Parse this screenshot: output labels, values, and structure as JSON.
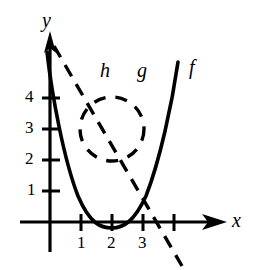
{
  "figure": {
    "background_color": "#ffffff",
    "ink_color": "#000000"
  },
  "axes": {
    "x_axis_label": "x",
    "y_axis_label": "y",
    "origin_px": [
      50,
      222
    ],
    "unit_px": 31,
    "x_ticks": [
      {
        "value": "1",
        "label": "1"
      },
      {
        "value": "2",
        "label": "2"
      },
      {
        "value": "3",
        "label": "3"
      },
      {
        "value": "4",
        "label": ""
      }
    ],
    "y_ticks": [
      {
        "value": "1",
        "label": "1"
      },
      {
        "value": "2",
        "label": "2"
      },
      {
        "value": "3",
        "label": "3"
      },
      {
        "value": "4",
        "label": "4"
      }
    ],
    "x_arrow": true,
    "y_arrow": true,
    "grid": false
  },
  "curves": [
    {
      "name": "f",
      "label": "f",
      "style": "solid",
      "kind": "parabola",
      "equation": "y = (x - 2)^2",
      "vertex": [
        2,
        0
      ],
      "y_intercept": 4,
      "color": "#000000",
      "stroke_width": 3.2
    },
    {
      "name": "h",
      "label": "h",
      "style": "dashed",
      "kind": "circle",
      "equation": "(x - 2)^2 + (y - 3)^2 = 1",
      "center": [
        2,
        3
      ],
      "radius": 1,
      "color": "#000000",
      "stroke_width": 3.2
    },
    {
      "name": "g",
      "label": "g",
      "style": "dashed",
      "kind": "line",
      "equation": "y = -1.55x + 5.6",
      "slope": -1.55,
      "y_intercept": 5.6,
      "x_intercept": 3.6,
      "color": "#000000",
      "stroke_width": 3.2
    }
  ],
  "labels": {
    "h": "h",
    "g": "g",
    "f": "f",
    "x": "x",
    "y": "y",
    "y_tick_4": "4",
    "y_tick_3": "3",
    "y_tick_2": "2",
    "y_tick_1": "1",
    "x_tick_1": "1",
    "x_tick_2": "2",
    "x_tick_3": "3"
  }
}
